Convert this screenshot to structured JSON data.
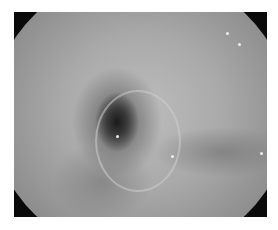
{
  "image": {
    "subject": "endoscopic view of lumen",
    "palette": {
      "background": "#ffffff",
      "vignette": "#0a0a0a",
      "mucosa": "#a9a9a9",
      "lumen": "#1a1a1a"
    },
    "caption": ""
  }
}
